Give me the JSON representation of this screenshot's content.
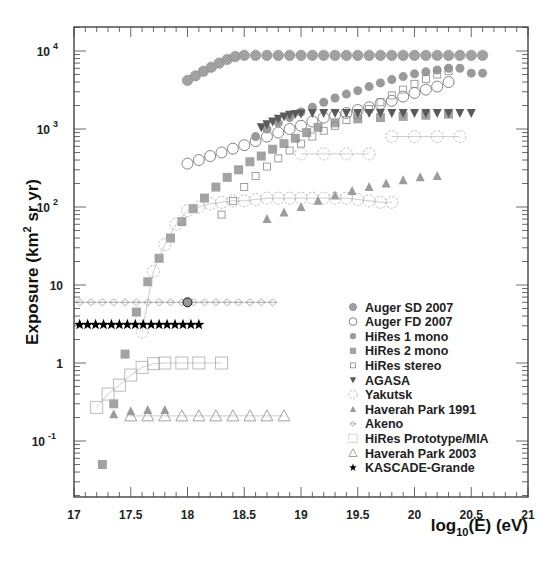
{
  "chart_data": {
    "type": "scatter",
    "title": "",
    "xlabel": "log10(E) (eV)",
    "ylabel": "Exposure (km^2 sr yr)",
    "xscale": "linear",
    "yscale": "log",
    "xlim": [
      17,
      21
    ],
    "ylim": [
      0.03,
      20000
    ],
    "grid": false,
    "legend_position": "lower right",
    "x_ticks": [
      "17",
      "17.5",
      "18",
      "18.5",
      "19",
      "19.5",
      "20",
      "20.5",
      "21"
    ],
    "y_ticks": [
      "10^-1",
      "1",
      "10",
      "10^2",
      "10^3",
      "10^4"
    ],
    "series": [
      {
        "name": "Auger SD 2007",
        "marker": "filled-circle-hatched",
        "color": "#8c8c8c",
        "x": [
          18.0,
          18.07,
          18.14,
          18.21,
          18.28,
          18.35,
          18.42,
          18.5,
          18.6,
          18.7,
          18.8,
          18.9,
          19.0,
          19.1,
          19.2,
          19.3,
          19.4,
          19.5,
          19.6,
          19.7,
          19.8,
          19.9,
          20.0,
          20.1,
          20.2,
          20.3,
          20.4,
          20.5,
          20.6
        ],
        "values": [
          4200,
          4800,
          5500,
          6200,
          7000,
          7800,
          8500,
          8800,
          8800,
          8800,
          8800,
          8800,
          8800,
          8800,
          8800,
          8800,
          8800,
          8800,
          8800,
          8800,
          8800,
          8800,
          8800,
          8800,
          8800,
          8800,
          8800,
          8800,
          8800
        ]
      },
      {
        "name": "Auger FD 2007",
        "marker": "open-circle",
        "color": "#666666",
        "x": [
          18.0,
          18.1,
          18.2,
          18.3,
          18.4,
          18.5,
          18.6,
          18.7,
          18.8,
          18.9,
          19.0,
          19.1,
          19.2,
          19.3,
          19.4,
          19.5,
          19.6,
          19.7,
          19.8,
          19.9,
          20.0,
          20.1,
          20.2,
          20.3
        ],
        "values": [
          360,
          400,
          450,
          500,
          560,
          620,
          700,
          800,
          900,
          1000,
          1100,
          1250,
          1400,
          1500,
          1600,
          1750,
          1900,
          2100,
          2300,
          2600,
          2900,
          3200,
          3500,
          4000
        ]
      },
      {
        "name": "HiRes 1 mono",
        "marker": "filled-circle",
        "color": "#999999",
        "x": [
          18.6,
          18.7,
          18.8,
          18.9,
          19.0,
          19.1,
          19.2,
          19.3,
          19.4,
          19.5,
          19.6,
          19.7,
          19.8,
          19.9,
          20.0,
          20.1,
          20.2,
          20.3,
          20.4,
          20.5,
          20.6
        ],
        "values": [
          800,
          1000,
          1200,
          1400,
          1650,
          1900,
          2200,
          2500,
          2800,
          3100,
          3500,
          3900,
          4300,
          4700,
          5100,
          5400,
          5700,
          6000,
          6000,
          5200,
          5200
        ]
      },
      {
        "name": "HiRes 2 mono",
        "marker": "filled-square",
        "color": "#a0a0a0",
        "x": [
          17.25,
          17.35,
          17.45,
          17.55,
          17.65,
          17.75,
          17.85,
          17.95,
          18.05,
          18.15,
          18.25,
          18.35,
          18.45,
          18.55,
          18.65,
          18.75,
          18.85,
          18.95,
          19.05,
          19.15,
          19.3,
          19.5,
          19.7,
          19.9,
          20.1,
          20.3
        ],
        "values": [
          0.05,
          0.3,
          1.3,
          4.5,
          11,
          22,
          40,
          65,
          95,
          130,
          180,
          240,
          300,
          380,
          450,
          550,
          650,
          760,
          900,
          1050,
          1200,
          1350,
          1400,
          1450,
          1500,
          1550
        ]
      },
      {
        "name": "HiRes stereo",
        "marker": "open-square-small",
        "color": "#888888",
        "x": [
          18.3,
          18.4,
          18.5,
          18.6,
          18.7,
          18.8,
          18.9,
          19.0,
          19.1,
          19.2,
          19.3,
          19.4,
          19.5,
          19.6,
          19.7,
          19.8,
          19.9,
          20.0,
          20.1,
          20.2,
          20.3
        ],
        "values": [
          80,
          120,
          180,
          250,
          330,
          420,
          530,
          650,
          800,
          950,
          1100,
          1300,
          1500,
          1800,
          2200,
          2700,
          3200,
          3800,
          4400,
          5000,
          5500
        ]
      },
      {
        "name": "AGASA",
        "marker": "filled-triangle-down",
        "color": "#555555",
        "x": [
          18.65,
          18.7,
          18.75,
          18.8,
          18.85,
          18.9,
          18.95,
          19.0,
          19.1,
          19.2,
          19.3,
          19.4,
          19.5,
          19.6,
          19.7,
          19.8,
          19.9,
          20.0,
          20.1,
          20.2,
          20.3,
          20.4,
          20.5
        ],
        "values": [
          1050,
          1150,
          1250,
          1350,
          1450,
          1520,
          1560,
          1580,
          1600,
          1600,
          1600,
          1600,
          1600,
          1600,
          1600,
          1600,
          1600,
          1600,
          1600,
          1600,
          1600,
          1600,
          1600
        ]
      },
      {
        "name": "Yakutsk",
        "marker": "open-circle-dashed",
        "color": "#aaaaaa",
        "x": [
          17.6,
          17.7,
          17.8,
          17.9,
          18.0,
          18.1,
          18.2,
          18.3,
          18.4,
          18.5,
          18.6,
          18.7,
          18.8,
          18.9,
          19.0,
          19.1,
          19.2,
          19.3,
          19.4,
          19.5,
          19.6,
          19.7,
          19.8
        ],
        "values": [
          2.5,
          15,
          33,
          60,
          90,
          100,
          110,
          115,
          120,
          120,
          125,
          130,
          130,
          130,
          130,
          130,
          130,
          130,
          130,
          125,
          120,
          115,
          115
        ]
      },
      {
        "name": "Yakutsk (high-E segments)",
        "marker": "open-circle-dashed",
        "color": "#aaaaaa",
        "x": [
          19.0,
          19.2,
          19.4,
          19.6,
          19.8,
          20.0,
          20.2,
          20.4
        ],
        "values": [
          480,
          480,
          480,
          480,
          800,
          800,
          800,
          800
        ]
      },
      {
        "name": "Haverah Park 1991",
        "marker": "filled-triangle-up",
        "color": "#999999",
        "x": [
          17.35,
          17.5,
          17.65,
          17.8,
          18.7,
          18.85,
          19.0,
          19.15,
          19.3,
          19.45,
          19.6,
          19.75,
          19.9,
          20.05,
          20.2
        ],
        "values": [
          0.22,
          0.24,
          0.25,
          0.25,
          70,
          85,
          100,
          120,
          140,
          160,
          180,
          200,
          220,
          240,
          250
        ]
      },
      {
        "name": "Akeno",
        "marker": "open-diamond-cross",
        "color": "#999999",
        "x": [
          17.05,
          17.15,
          17.25,
          17.35,
          17.45,
          17.55,
          17.65,
          17.75,
          17.85,
          17.95,
          18.05,
          18.15,
          18.25,
          18.35,
          18.45,
          18.55,
          18.65,
          18.75
        ],
        "values": [
          6,
          6,
          6,
          6,
          6,
          6,
          6,
          6,
          6,
          6,
          6,
          6,
          6,
          6,
          6,
          6,
          6,
          6
        ]
      },
      {
        "name": "HiRes Prototype/MIA",
        "marker": "open-square-large",
        "color": "#aaaaaa",
        "x": [
          17.2,
          17.3,
          17.4,
          17.5,
          17.6,
          17.7,
          17.8,
          17.95,
          18.1,
          18.3
        ],
        "values": [
          0.27,
          0.4,
          0.52,
          0.7,
          0.88,
          0.98,
          1.0,
          1.0,
          1.0,
          1.0
        ]
      },
      {
        "name": "Haverah Park 2003",
        "marker": "open-triangle-up",
        "color": "#999999",
        "x": [
          17.5,
          17.65,
          17.8,
          17.95,
          18.1,
          18.25,
          18.4,
          18.55,
          18.7,
          18.85
        ],
        "values": [
          0.21,
          0.21,
          0.21,
          0.21,
          0.21,
          0.21,
          0.21,
          0.21,
          0.21,
          0.21
        ]
      },
      {
        "name": "KASCADE-Grande",
        "marker": "filled-star",
        "color": "#000000",
        "x": [
          17.05,
          17.12,
          17.19,
          17.26,
          17.33,
          17.4,
          17.47,
          17.54,
          17.61,
          17.68,
          17.75,
          17.82,
          17.89,
          17.96,
          18.03,
          18.1
        ],
        "values": [
          3.1,
          3.1,
          3.1,
          3.1,
          3.1,
          3.1,
          3.1,
          3.1,
          3.1,
          3.1,
          3.1,
          3.1,
          3.1,
          3.1,
          3.1,
          3.1
        ]
      }
    ]
  },
  "axes": {
    "x_title_main": "log",
    "x_title_sub": "10",
    "x_title_rest": "(E) (eV)",
    "y_title_main": "Exposure (km",
    "y_title_sup": "2",
    "y_title_rest": " sr yr)"
  },
  "legend": {
    "items": [
      {
        "label": "Auger SD 2007",
        "marker": "filled-circle-hatched"
      },
      {
        "label": "Auger FD 2007",
        "marker": "open-circle"
      },
      {
        "label": "HiRes 1 mono",
        "marker": "filled-circle"
      },
      {
        "label": "HiRes 2 mono",
        "marker": "filled-square"
      },
      {
        "label": "HiRes stereo",
        "marker": "open-square-small"
      },
      {
        "label": "AGASA",
        "marker": "filled-triangle-down"
      },
      {
        "label": "Yakutsk",
        "marker": "open-circle-dashed"
      },
      {
        "label": "Haverah Park 1991",
        "marker": "filled-triangle-up"
      },
      {
        "label": "Akeno",
        "marker": "open-diamond-cross"
      },
      {
        "label": "HiRes Prototype/MIA",
        "marker": "open-square-large"
      },
      {
        "label": "Haverah Park 2003",
        "marker": "open-triangle-up"
      },
      {
        "label": "KASCADE-Grande",
        "marker": "filled-star"
      }
    ]
  }
}
